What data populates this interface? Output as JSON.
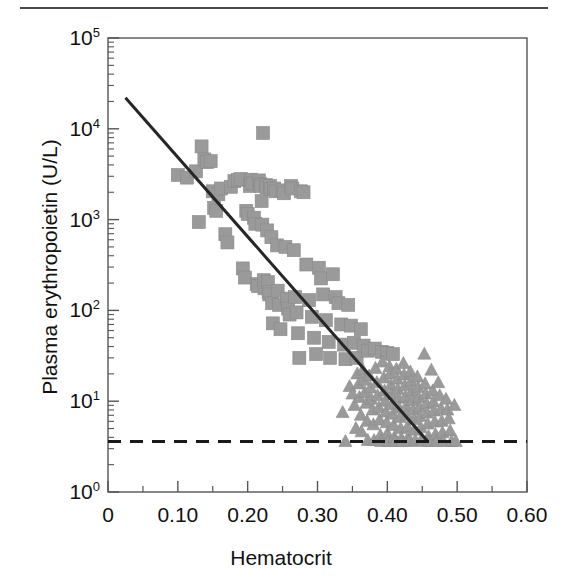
{
  "figure": {
    "caption_rule": "top-horizontal-rule"
  },
  "axes": {
    "x_title": "Hematocrit",
    "y_title": "Plasma erythropoietin (U/L)",
    "x_ticks": [
      "0",
      "0.10",
      "0.20",
      "0.30",
      "0.40",
      "0.50",
      "0.60"
    ],
    "y_ticks": [
      "10",
      "10",
      "10",
      "10",
      "10",
      "10"
    ],
    "y_tick_exponents": [
      "0",
      "1",
      "2",
      "3",
      "4",
      "5"
    ]
  },
  "colors": {
    "marker_gray": "#9a9a9a",
    "marker_edge": "#8a8a8a",
    "regression_line": "#262626",
    "detection_line": "#1a1a1a",
    "frame": "#555555",
    "text": "#111111"
  },
  "chart_data": {
    "type": "scatter",
    "title": "",
    "xlabel": "Hematocrit",
    "ylabel": "Plasma erythropoietin (U/L)",
    "xlim": [
      0,
      0.6
    ],
    "ylim": [
      1,
      100000
    ],
    "yscale": "log",
    "xscale": "linear",
    "grid": false,
    "legend": "none",
    "x_ticks": [
      0,
      0.1,
      0.2,
      0.3,
      0.4,
      0.5,
      0.6
    ],
    "y_ticks": [
      1,
      10,
      100,
      1000,
      10000,
      100000
    ],
    "y_tick_labels": [
      "10^0",
      "10^1",
      "10^2",
      "10^3",
      "10^4",
      "10^5"
    ],
    "x_minor_ticks_per_interval": 1,
    "y_minor_ticks": "log-decade-subdivisions",
    "annotations": [
      {
        "name": "regression-line",
        "type": "line",
        "style": "solid",
        "color": "#262626",
        "width_px": 3,
        "x0": 0.025,
        "y0": 22000,
        "x1": 0.458,
        "y1": 3.6
      },
      {
        "name": "detection-limit-line",
        "type": "line",
        "style": "dashed",
        "color": "#1a1a1a",
        "width_px": 3,
        "x0": 0.0,
        "y0": 3.6,
        "x1": 0.6,
        "y1": 3.6
      }
    ],
    "series": [
      {
        "name": "anemic-patients",
        "marker": "square",
        "color": "#9a9a9a",
        "size_px": 13,
        "points": [
          [
            0.1,
            3100
          ],
          [
            0.113,
            2900
          ],
          [
            0.126,
            3400
          ],
          [
            0.13,
            940
          ],
          [
            0.134,
            6400
          ],
          [
            0.138,
            4600
          ],
          [
            0.142,
            4300
          ],
          [
            0.147,
            4400
          ],
          [
            0.15,
            2050
          ],
          [
            0.152,
            1350
          ],
          [
            0.155,
            1250
          ],
          [
            0.158,
            1900
          ],
          [
            0.162,
            2200
          ],
          [
            0.168,
            690
          ],
          [
            0.171,
            560
          ],
          [
            0.176,
            2300
          ],
          [
            0.181,
            2650
          ],
          [
            0.186,
            2750
          ],
          [
            0.19,
            2800
          ],
          [
            0.193,
            290
          ],
          [
            0.196,
            230
          ],
          [
            0.198,
            1250
          ],
          [
            0.2,
            1150
          ],
          [
            0.203,
            2350
          ],
          [
            0.205,
            2750
          ],
          [
            0.207,
            2500
          ],
          [
            0.209,
            1050
          ],
          [
            0.211,
            900
          ],
          [
            0.213,
            195
          ],
          [
            0.215,
            185
          ],
          [
            0.216,
            2700
          ],
          [
            0.218,
            2450
          ],
          [
            0.219,
            2350
          ],
          [
            0.22,
            1600
          ],
          [
            0.221,
            880
          ],
          [
            0.222,
            9000
          ],
          [
            0.223,
            215
          ],
          [
            0.224,
            175
          ],
          [
            0.226,
            2400
          ],
          [
            0.227,
            2250
          ],
          [
            0.228,
            760
          ],
          [
            0.229,
            205
          ],
          [
            0.23,
            160
          ],
          [
            0.231,
            150
          ],
          [
            0.232,
            2350
          ],
          [
            0.233,
            2150
          ],
          [
            0.234,
            640
          ],
          [
            0.235,
            120
          ],
          [
            0.236,
            72
          ],
          [
            0.238,
            2200
          ],
          [
            0.24,
            2050
          ],
          [
            0.242,
            520
          ],
          [
            0.243,
            165
          ],
          [
            0.245,
            115
          ],
          [
            0.247,
            62
          ],
          [
            0.25,
            2100
          ],
          [
            0.252,
            1950
          ],
          [
            0.254,
            500
          ],
          [
            0.256,
            135
          ],
          [
            0.258,
            105
          ],
          [
            0.26,
            90
          ],
          [
            0.262,
            2350
          ],
          [
            0.264,
            2200
          ],
          [
            0.266,
            460
          ],
          [
            0.268,
            140
          ],
          [
            0.27,
            95
          ],
          [
            0.272,
            56
          ],
          [
            0.274,
            30
          ],
          [
            0.276,
            2050
          ],
          [
            0.28,
            2000
          ],
          [
            0.284,
            320
          ],
          [
            0.288,
            130
          ],
          [
            0.292,
            85
          ],
          [
            0.295,
            50
          ],
          [
            0.298,
            33
          ],
          [
            0.302,
            295
          ],
          [
            0.305,
            225
          ],
          [
            0.308,
            150
          ],
          [
            0.312,
            78
          ],
          [
            0.316,
            45
          ],
          [
            0.318,
            30
          ],
          [
            0.322,
            250
          ],
          [
            0.326,
            140
          ],
          [
            0.33,
            120
          ],
          [
            0.334,
            70
          ],
          [
            0.338,
            42
          ],
          [
            0.34,
            29
          ],
          [
            0.344,
            115
          ],
          [
            0.348,
            68
          ],
          [
            0.352,
            44
          ],
          [
            0.356,
            30
          ],
          [
            0.362,
            62
          ],
          [
            0.366,
            41
          ],
          [
            0.372,
            36
          ],
          [
            0.382,
            38
          ],
          [
            0.392,
            35
          ],
          [
            0.4,
            34
          ],
          [
            0.408,
            33
          ]
        ]
      },
      {
        "name": "normal-subjects",
        "marker": "triangle",
        "color": "#9a9a9a",
        "size_px": 13,
        "points": [
          [
            0.336,
            7.5
          ],
          [
            0.34,
            3.6
          ],
          [
            0.346,
            14.5
          ],
          [
            0.35,
            12.0
          ],
          [
            0.353,
            9.0
          ],
          [
            0.355,
            5.0
          ],
          [
            0.357,
            20.0
          ],
          [
            0.359,
            15.5
          ],
          [
            0.36,
            11.0
          ],
          [
            0.362,
            7.0
          ],
          [
            0.363,
            4.6
          ],
          [
            0.365,
            22.0
          ],
          [
            0.367,
            17.0
          ],
          [
            0.368,
            12.5
          ],
          [
            0.37,
            9.5
          ],
          [
            0.371,
            6.0
          ],
          [
            0.372,
            3.7
          ],
          [
            0.374,
            19.0
          ],
          [
            0.376,
            14.0
          ],
          [
            0.377,
            10.5
          ],
          [
            0.379,
            8.0
          ],
          [
            0.38,
            5.5
          ],
          [
            0.381,
            3.7
          ],
          [
            0.383,
            23.0
          ],
          [
            0.385,
            16.0
          ],
          [
            0.386,
            11.5
          ],
          [
            0.388,
            8.5
          ],
          [
            0.389,
            6.2
          ],
          [
            0.39,
            4.2
          ],
          [
            0.391,
            3.6
          ],
          [
            0.393,
            27.0
          ],
          [
            0.395,
            18.0
          ],
          [
            0.396,
            13.0
          ],
          [
            0.397,
            10.0
          ],
          [
            0.398,
            7.6
          ],
          [
            0.399,
            5.8
          ],
          [
            0.4,
            4.4
          ],
          [
            0.401,
            3.6
          ],
          [
            0.403,
            24.0
          ],
          [
            0.404,
            20.0
          ],
          [
            0.405,
            15.0
          ],
          [
            0.406,
            11.8
          ],
          [
            0.407,
            9.2
          ],
          [
            0.408,
            7.2
          ],
          [
            0.409,
            5.4
          ],
          [
            0.41,
            4.0
          ],
          [
            0.411,
            3.6
          ],
          [
            0.413,
            22.5
          ],
          [
            0.414,
            17.5
          ],
          [
            0.415,
            13.5
          ],
          [
            0.416,
            10.8
          ],
          [
            0.417,
            8.4
          ],
          [
            0.418,
            6.6
          ],
          [
            0.419,
            5.0
          ],
          [
            0.42,
            3.9
          ],
          [
            0.421,
            3.6
          ],
          [
            0.423,
            26.0
          ],
          [
            0.424,
            19.5
          ],
          [
            0.425,
            14.8
          ],
          [
            0.426,
            11.2
          ],
          [
            0.427,
            8.8
          ],
          [
            0.428,
            7.0
          ],
          [
            0.429,
            5.2
          ],
          [
            0.43,
            4.0
          ],
          [
            0.431,
            3.6
          ],
          [
            0.433,
            21.0
          ],
          [
            0.434,
            16.5
          ],
          [
            0.435,
            12.8
          ],
          [
            0.436,
            10.2
          ],
          [
            0.437,
            8.0
          ],
          [
            0.438,
            6.3
          ],
          [
            0.439,
            4.8
          ],
          [
            0.44,
            3.7
          ],
          [
            0.443,
            18.5
          ],
          [
            0.444,
            14.2
          ],
          [
            0.445,
            11.0
          ],
          [
            0.446,
            8.6
          ],
          [
            0.447,
            6.8
          ],
          [
            0.448,
            5.1
          ],
          [
            0.449,
            3.8
          ],
          [
            0.45,
            3.6
          ],
          [
            0.453,
            33.0
          ],
          [
            0.454,
            15.5
          ],
          [
            0.455,
            12.0
          ],
          [
            0.456,
            9.4
          ],
          [
            0.457,
            7.4
          ],
          [
            0.458,
            5.6
          ],
          [
            0.459,
            4.1
          ],
          [
            0.46,
            3.6
          ],
          [
            0.463,
            22.0
          ],
          [
            0.465,
            13.0
          ],
          [
            0.466,
            9.8
          ],
          [
            0.467,
            7.8
          ],
          [
            0.468,
            5.9
          ],
          [
            0.469,
            4.3
          ],
          [
            0.47,
            3.6
          ],
          [
            0.473,
            16.0
          ],
          [
            0.475,
            11.5
          ],
          [
            0.477,
            8.2
          ],
          [
            0.478,
            6.0
          ],
          [
            0.479,
            4.5
          ],
          [
            0.48,
            3.6
          ],
          [
            0.484,
            10.5
          ],
          [
            0.486,
            8.0
          ],
          [
            0.488,
            6.4
          ],
          [
            0.49,
            4.7
          ],
          [
            0.492,
            3.6
          ],
          [
            0.496,
            9.0
          ],
          [
            0.498,
            3.6
          ]
        ]
      }
    ]
  }
}
